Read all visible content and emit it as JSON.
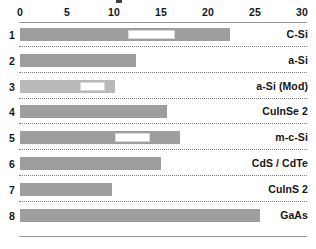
{
  "chart_data": {
    "type": "bar",
    "orientation": "horizontal",
    "title": "",
    "xlabel": "",
    "ylabel": "",
    "xlim": [
      0,
      30
    ],
    "xticks": [
      0,
      5,
      10,
      15,
      20,
      25,
      30
    ],
    "xtick_labels": [
      "0",
      "5",
      "10",
      "15",
      "20",
      "25",
      "30"
    ],
    "grid": false,
    "legend": null,
    "categories": [
      "C-Si",
      "a-Si",
      "a-Si  (Mod)",
      "CuInSe 2",
      "m-c-Si",
      "CdS / CdTe",
      "CuInS 2",
      "GaAs"
    ],
    "row_numbers": [
      "1",
      "2",
      "3",
      "4",
      "5",
      "6",
      "7",
      "8"
    ],
    "values": [
      22.3,
      12.3,
      10.1,
      15.6,
      17.0,
      15.0,
      9.8,
      25.5
    ],
    "bars": [
      {
        "index": "1",
        "label": "C-Si",
        "start": 0,
        "end": 22.3,
        "shade": "dark",
        "gap": {
          "start": 11.5,
          "end": 16.5
        }
      },
      {
        "index": "2",
        "label": "a-Si",
        "start": 0,
        "end": 12.3,
        "shade": "dark",
        "gap": null
      },
      {
        "index": "3",
        "label": "a-Si  (Mod)",
        "start": 0,
        "end": 10.1,
        "shade": "light",
        "gap": {
          "start": 6.4,
          "end": 9.0
        }
      },
      {
        "index": "4",
        "label": "CuInSe 2",
        "start": 0,
        "end": 15.6,
        "shade": "dark",
        "gap": null
      },
      {
        "index": "5",
        "label": "m-c-Si",
        "start": 0,
        "end": 17.0,
        "shade": "dark",
        "gap": {
          "start": 10.1,
          "end": 13.8
        }
      },
      {
        "index": "6",
        "label": "CdS / CdTe",
        "start": 0,
        "end": 15.0,
        "shade": "dark",
        "gap": null
      },
      {
        "index": "7",
        "label": "CuInS 2",
        "start": 0,
        "end": 9.8,
        "shade": "dark",
        "gap": null
      },
      {
        "index": "8",
        "label": "GaAs",
        "start": 0,
        "end": 25.5,
        "shade": "dark",
        "gap": null
      }
    ],
    "colors": {
      "bar_dark": "#9e9e9e",
      "bar_light": "#b9b9b9",
      "gap_fill": "#ffffff",
      "axis_rule": "#9a9a9a",
      "separator_dotted": "#7d7d7d",
      "text": "#161616",
      "background": "#ffffff"
    }
  }
}
